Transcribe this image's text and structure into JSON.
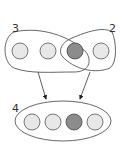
{
  "diagram": {
    "top_left_group": {
      "label": "3",
      "items": [
        "light",
        "light",
        "dark"
      ]
    },
    "top_right_group": {
      "label": "2",
      "items": [
        "dark",
        "light"
      ]
    },
    "bottom_group": {
      "label": "4",
      "items": [
        "light",
        "light",
        "dark",
        "light"
      ]
    },
    "arrows": [
      {
        "from": "3",
        "to": "4"
      },
      {
        "from": "2",
        "to": "4"
      }
    ],
    "colors": {
      "light_fill": "#e8e8e8",
      "dark_fill": "#8c8c8c",
      "stroke": "#555555"
    }
  }
}
